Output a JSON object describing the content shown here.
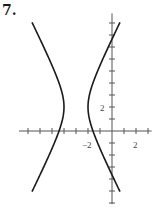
{
  "problem": {
    "number": "7."
  },
  "chart_data": {
    "type": "line",
    "title": "",
    "xlabel": "",
    "ylabel": "",
    "equation": "(x+3)^2 - (y-2)^2/4 = 1",
    "center": [
      -3,
      2
    ],
    "vertices": [
      [
        -4,
        2
      ],
      [
        -2,
        2
      ]
    ],
    "xlim": [
      -7.75,
      3.3
    ],
    "ylim": [
      -6.1,
      9.8
    ],
    "x_tick_step": 1,
    "y_tick_step": 1,
    "x_tick_labels": [
      {
        "value": -2,
        "label": "-2"
      },
      {
        "value": 2,
        "label": "2"
      }
    ],
    "y_tick_labels": [
      {
        "value": 2,
        "label": "2"
      }
    ],
    "grid": false,
    "series": [
      {
        "name": "left-branch",
        "x": [
          -6.67,
          -5.5,
          -4.5,
          -4.0,
          -4.5,
          -5.5,
          -6.67
        ],
        "y": [
          9.06,
          6.58,
          4.24,
          2.0,
          -0.24,
          -2.58,
          -5.06
        ]
      },
      {
        "name": "right-branch",
        "x": [
          0.67,
          -0.5,
          -1.5,
          -2.0,
          -1.5,
          -0.5,
          0.67
        ],
        "y": [
          9.06,
          6.58,
          4.24,
          2.0,
          -0.24,
          -2.58,
          -5.06
        ]
      }
    ]
  },
  "labels": {
    "x_neg2": "−2",
    "x_pos2": "2",
    "y_pos2": "2"
  }
}
